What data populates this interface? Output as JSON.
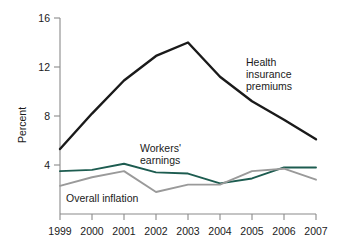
{
  "chart_data": {
    "type": "line",
    "title": "",
    "xlabel": "",
    "ylabel": "Percent",
    "x": [
      1999,
      2000,
      2001,
      2002,
      2003,
      2004,
      2005,
      2006,
      2007
    ],
    "xtick_labels": [
      "1999",
      "2000",
      "2001",
      "2002",
      "2003",
      "2004",
      "2005",
      "2006",
      "2007"
    ],
    "ytick_labels": [
      "4",
      "8",
      "12",
      "16"
    ],
    "yticks": [
      4,
      8,
      12,
      16
    ],
    "ylim": [
      0,
      16
    ],
    "xlim": [
      1999,
      2007
    ],
    "grid": false,
    "legend_position": "inline-annotations",
    "series": [
      {
        "name": "Health insurance premiums",
        "color": "#1a1a1a",
        "values": [
          5.3,
          8.2,
          10.9,
          12.9,
          14.0,
          11.2,
          9.2,
          7.7,
          6.1
        ]
      },
      {
        "name": "Workers' earnings",
        "color": "#1d5c50",
        "values": [
          3.5,
          3.6,
          4.1,
          3.4,
          3.3,
          2.5,
          2.9,
          3.8,
          3.8
        ]
      },
      {
        "name": "Overall inflation",
        "color": "#9a9a9a",
        "values": [
          2.3,
          3.0,
          3.5,
          1.8,
          2.4,
          2.4,
          3.5,
          3.7,
          2.8
        ]
      }
    ],
    "annotations": [
      {
        "name": "health-insurance-premiums",
        "lines": [
          "Health",
          "insurance",
          "premiums"
        ],
        "x": 246,
        "y": 66
      },
      {
        "name": "workers-earnings",
        "lines": [
          "Workers'",
          "earnings"
        ],
        "x": 140,
        "y": 152
      },
      {
        "name": "overall-inflation",
        "lines": [
          "Overall inflation"
        ],
        "x": 66,
        "y": 202
      }
    ]
  },
  "axis": {
    "y_title": "Percent"
  }
}
